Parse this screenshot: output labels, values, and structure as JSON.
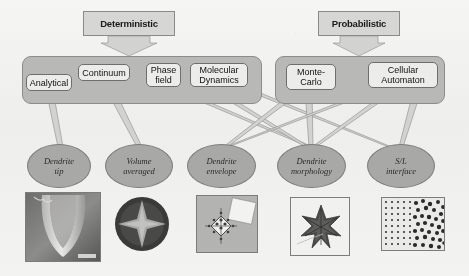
{
  "figure": {
    "background_color": "#f2f1ee"
  },
  "banners": [
    {
      "id": "deterministic",
      "label": "Deterministic",
      "x": 83,
      "y": 11,
      "w": 92,
      "h": 25,
      "tip_h": 13
    },
    {
      "id": "probabilistic",
      "label": "Probabilistic",
      "x": 318,
      "y": 11,
      "w": 82,
      "h": 25,
      "tip_h": 13
    }
  ],
  "groups": [
    {
      "id": "deterministic-group",
      "x": 22,
      "y": 56,
      "w": 240,
      "h": 48,
      "color": "#b9b8b4"
    },
    {
      "id": "probabilistic-group",
      "x": 275,
      "y": 56,
      "w": 170,
      "h": 48,
      "color": "#b9b8b4"
    }
  ],
  "methods": [
    {
      "id": "analytical",
      "label": "Analytical",
      "lines": [
        "Analytical"
      ],
      "x": 26,
      "y": 74,
      "w": 46,
      "h": 17
    },
    {
      "id": "continuum",
      "label": "Continuum",
      "lines": [
        "Continuum"
      ],
      "x": 78,
      "y": 64,
      "w": 52,
      "h": 17
    },
    {
      "id": "phase-field",
      "label": "Phase field",
      "lines": [
        "Phase",
        "field"
      ],
      "x": 146,
      "y": 63,
      "w": 35,
      "h": 24
    },
    {
      "id": "molecular-dynamics",
      "label": "Molecular Dynamics",
      "lines": [
        "Molecular",
        "Dynamics"
      ],
      "x": 190,
      "y": 63,
      "w": 58,
      "h": 24
    },
    {
      "id": "monte-carlo",
      "label": "Monte-Carlo",
      "lines": [
        "Monte-",
        "Carlo"
      ],
      "x": 286,
      "y": 64,
      "w": 50,
      "h": 26
    },
    {
      "id": "cellular-automaton",
      "label": "Cellular Automaton",
      "lines": [
        "Cellular",
        "Automaton"
      ],
      "x": 368,
      "y": 62,
      "w": 70,
      "h": 26
    }
  ],
  "outcomes": [
    {
      "id": "dendrite-tip",
      "lines": [
        "Dendrite",
        "tip"
      ],
      "x": 27,
      "y": 144,
      "w": 64,
      "h": 44
    },
    {
      "id": "volume-averaged",
      "lines": [
        "Volume",
        "averaged"
      ],
      "x": 105,
      "y": 144,
      "w": 68,
      "h": 44
    },
    {
      "id": "dendrite-envelope",
      "lines": [
        "Dendrite",
        "envelope"
      ],
      "x": 187,
      "y": 144,
      "w": 69,
      "h": 44
    },
    {
      "id": "dendrite-morphology",
      "lines": [
        "Dendrite",
        "morphology"
      ],
      "x": 277,
      "y": 144,
      "w": 69,
      "h": 44
    },
    {
      "id": "sl-interface",
      "lines": [
        "S/L",
        "interface"
      ],
      "x": 367,
      "y": 144,
      "w": 68,
      "h": 44
    }
  ],
  "micrographs": [
    {
      "id": "dendrite-tip-micrograph",
      "caption": "dendrite tip micrograph",
      "x": 25,
      "y": 192,
      "w": 76,
      "h": 70
    },
    {
      "id": "volume-averaged-simulation",
      "caption": "volume averaged grain simulation",
      "x": 113,
      "y": 196,
      "w": 58,
      "h": 56
    },
    {
      "id": "dendrite-envelope-simulation",
      "caption": "dendrite envelope simulation",
      "x": 196,
      "y": 195,
      "w": 62,
      "h": 58
    },
    {
      "id": "dendrite-morphology-simulation",
      "caption": "dendrite morphology simulation",
      "x": 290,
      "y": 197,
      "w": 60,
      "h": 59
    },
    {
      "id": "sl-interface-simulation",
      "caption": "solid/liquid interface simulation",
      "x": 381,
      "y": 197,
      "w": 64,
      "h": 54
    }
  ],
  "connectors": [
    {
      "from": "deterministic",
      "to": "deterministic-group"
    },
    {
      "from": "probabilistic",
      "to": "probabilistic-group"
    },
    {
      "from": "analytical",
      "to": "dendrite-tip"
    },
    {
      "from": "continuum",
      "to": "volume-averaged"
    },
    {
      "from": "phase-field",
      "to": "dendrite-morphology"
    },
    {
      "from": "molecular-dynamics",
      "to": "dendrite-morphology"
    },
    {
      "from": "molecular-dynamics",
      "to": "sl-interface"
    },
    {
      "from": "monte-carlo",
      "to": "dendrite-envelope"
    },
    {
      "from": "monte-carlo",
      "to": "dendrite-morphology"
    },
    {
      "from": "cellular-automaton",
      "to": "dendrite-envelope"
    },
    {
      "from": "cellular-automaton",
      "to": "dendrite-morphology"
    },
    {
      "from": "cellular-automaton",
      "to": "sl-interface"
    }
  ],
  "palette": {
    "group_fill": "#b9b8b4",
    "box_fill": "#ececea",
    "ellipse_fill": "#a9a8a4",
    "banner_fill": "#d7d6d2",
    "stroke": "#7c7b77"
  }
}
